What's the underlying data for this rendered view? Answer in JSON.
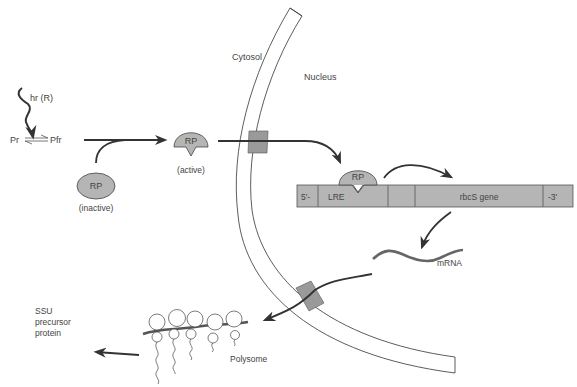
{
  "diagram": {
    "compartments": {
      "cytosol": "Cytosol",
      "nucleus": "Nucleus"
    },
    "light": {
      "label": "hr (R)",
      "phytochrome_left": "Pr",
      "phytochrome_right": "Pfr"
    },
    "regulatory_protein": {
      "inactive_label": "RP",
      "inactive_caption": "(inactive)",
      "active_label": "RP",
      "active_caption": "(active)",
      "bound_label": "RP"
    },
    "gene": {
      "five_prime": "5'-",
      "lre": "LRE",
      "gene_name": "rbcS gene",
      "three_prime": "-3'"
    },
    "mrna_label": "mRNA",
    "polysome_label": "Polysome",
    "product": {
      "line1": "SSU",
      "line2": "precursor",
      "line3": "protein"
    },
    "colors": {
      "shape_fill": "#b5b5b5",
      "pore_fill": "#9a9a9a",
      "line": "#333333",
      "text": "#444444"
    }
  }
}
